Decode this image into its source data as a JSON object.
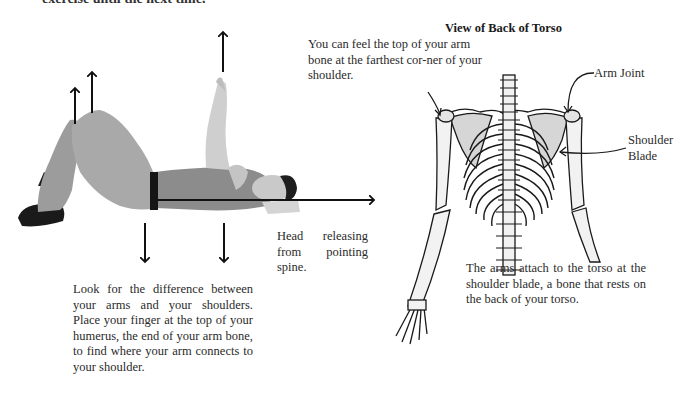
{
  "page": {
    "cut_off_top_line": "exercise until the next time."
  },
  "left_figure": {
    "description": "Photo of a person lying on back, knees bent, one arm raised, with directional arrows",
    "arrows": [
      "up-knee-left",
      "up-knee-right",
      "up-hand",
      "down-hip",
      "down-chest",
      "right-spine"
    ],
    "caption_head": "Head releasing from pointing spine.",
    "caption_main": "Look for the difference between your arms and your shoulders. Place your finger at the top of your humerus, the end of your arm bone, to find where your arm connects to your shoulder."
  },
  "right_figure": {
    "title": "View of Back of Torso",
    "feel_text": "You can feel the top of your arm bone at the farthest cor-ner of your shoulder.",
    "labels": {
      "arm_joint": "Arm Joint",
      "shoulder_blade_line1": "Shoulder",
      "shoulder_blade_line2": "Blade"
    },
    "caption": "The arms attach to the torso at the shoulder blade, a bone that rests on the back of your torso."
  },
  "colors": {
    "text": "#2a2a2a",
    "bone_fill": "#f2f2f2",
    "shoulder_blade_fill": "#d6d6d6",
    "outline": "#1a1a1a",
    "pants": "#a8a8a8",
    "shirt": "#8a8a8a",
    "skin": "#cfcfcf"
  }
}
